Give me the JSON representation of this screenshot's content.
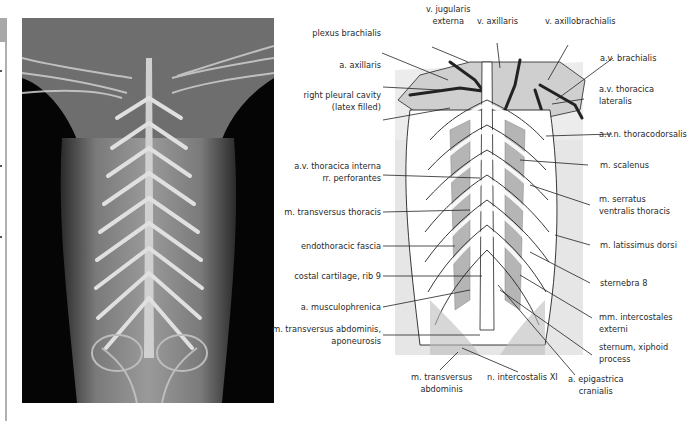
{
  "figure": {
    "photo_caption": "",
    "left_panel": {
      "dots": [
        70,
        165,
        236
      ]
    },
    "labels_left": [
      {
        "id": "plexus-brachialis",
        "text": "plexus brachialis"
      },
      {
        "id": "a-axillaris",
        "text": "a. axillaris"
      },
      {
        "id": "right-pleural-cavity",
        "line1": "right pleural cavity",
        "line2": "(latex filled)"
      },
      {
        "id": "av-thoracica-interna",
        "line1": "a.v. thoracica interna",
        "line2": "rr. perforantes"
      },
      {
        "id": "m-transversus-thoracis",
        "text": "m. transversus thoracis"
      },
      {
        "id": "endothoracic-fascia",
        "text": "endothoracic fascia"
      },
      {
        "id": "costal-cartilage",
        "text": "costal cartilage, rib 9"
      },
      {
        "id": "a-musculophrenica",
        "text": "a. musculophrenica"
      },
      {
        "id": "m-transversus-abdominis-aponeurosis",
        "line1": "m. transversus abdominis,",
        "line2": "aponeurosis"
      }
    ],
    "labels_top": [
      {
        "id": "v-jugularis-externa",
        "line1": "v. jugularis",
        "line2": "externa"
      },
      {
        "id": "v-axillaris",
        "text": "v. axillaris"
      },
      {
        "id": "v-axillobrachialis",
        "text": "v. axillobrachialis"
      }
    ],
    "labels_right": [
      {
        "id": "av-brachialis",
        "text": "a.v. brachialis"
      },
      {
        "id": "av-thoracica-lateralis",
        "line1": "a.v. thoracica",
        "line2": "lateralis"
      },
      {
        "id": "avn-thoracodorsalis",
        "text": "a.v.n. thoracodorsalis"
      },
      {
        "id": "m-scalenus",
        "text": "m. scalenus"
      },
      {
        "id": "m-serratus",
        "line1": "m. serratus",
        "line2": "ventralis thoracis"
      },
      {
        "id": "m-latissimus-dorsi",
        "text": "m. latissimus dorsi"
      },
      {
        "id": "sternebra-8",
        "text": "sternebra 8"
      },
      {
        "id": "mm-intercostales-externi",
        "line1": "mm. intercostales",
        "line2": "externi"
      },
      {
        "id": "sternum-xiphoid",
        "line1": "sternum, xiphoid",
        "line2": "process"
      }
    ],
    "labels_bottom": [
      {
        "id": "m-transversus-abdominis",
        "line1": "m. transversus",
        "line2": "abdominis"
      },
      {
        "id": "n-intercostalis-xi",
        "text": "n. intercostalis XI"
      },
      {
        "id": "a-epigastrica-cranialis",
        "line1": "a. epigastrica",
        "line2": "cranialis"
      }
    ],
    "colors": {
      "panel_bg": "#e6e6e6",
      "muscle_dark": "#555555",
      "vessel_dark": "#3a3a3a",
      "bone": "#ffffff",
      "line": "#222222"
    }
  }
}
